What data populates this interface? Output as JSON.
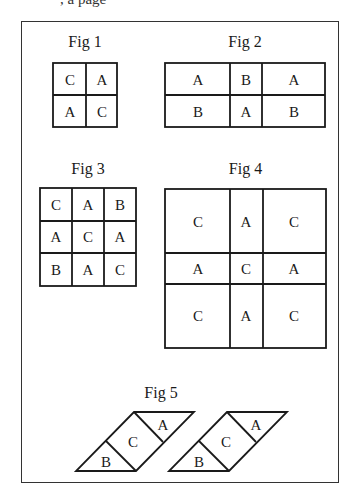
{
  "header_fragment": ", a page",
  "figures": {
    "fig1": {
      "label": "Fig 1",
      "cells": [
        "C",
        "A",
        "A",
        "C"
      ]
    },
    "fig2": {
      "label": "Fig 2",
      "cells": [
        "A",
        "B",
        "A",
        "B",
        "A",
        "B"
      ]
    },
    "fig3": {
      "label": "Fig 3",
      "cells": [
        "C",
        "A",
        "B",
        "A",
        "C",
        "A",
        "B",
        "A",
        "C"
      ]
    },
    "fig4": {
      "label": "Fig 4",
      "cells": [
        "C",
        "A",
        "C",
        "A",
        "C",
        "A",
        "C",
        "A",
        "C"
      ]
    },
    "fig5": {
      "label": "Fig 5",
      "shapes": [
        {
          "top": "A",
          "middle": "C",
          "bottom": "B"
        },
        {
          "top": "A",
          "middle": "C",
          "bottom": "B"
        }
      ]
    }
  },
  "colors": {
    "line": "#1a1a1a",
    "frame": "#333333",
    "background": "#ffffff"
  }
}
